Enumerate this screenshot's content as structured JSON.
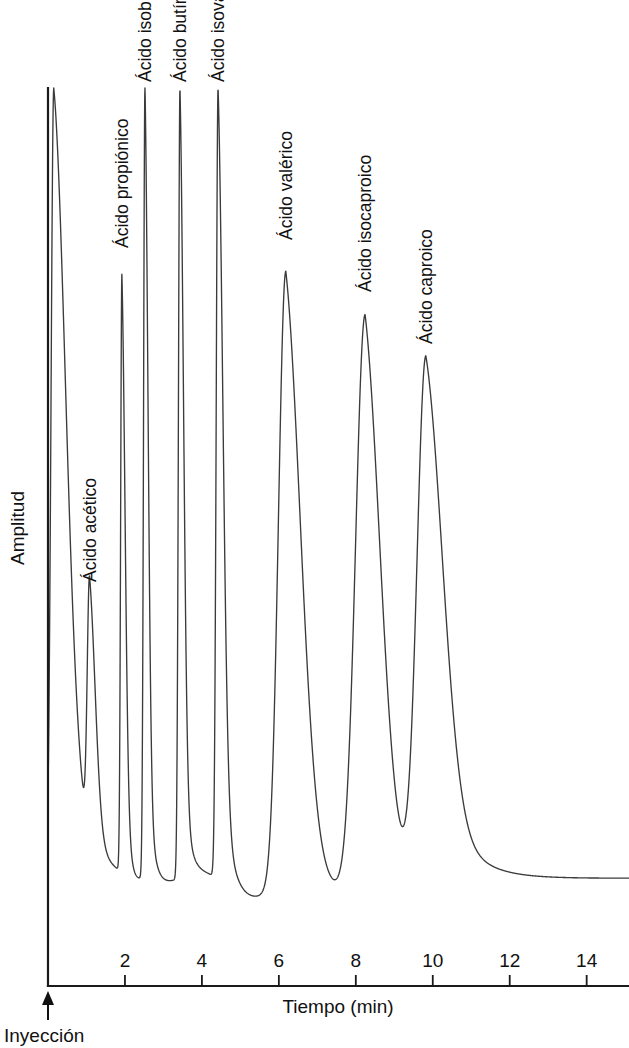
{
  "figure": {
    "kind": "chromatogram",
    "background_color": "#ffffff",
    "trace_color": "#3b3b3b",
    "axis_color": "#1a1a1a",
    "text_color": "#111111"
  },
  "chart_data": {
    "type": "line",
    "title": "",
    "subtitle": "",
    "xlabel": "Tiempo (min)",
    "ylabel": "Amplitud",
    "xlim": [
      0,
      15.1
    ],
    "ylim": [
      0,
      100
    ],
    "grid": false,
    "legend": "none",
    "x_ticks": [
      2,
      4,
      6,
      8,
      10,
      12,
      14
    ],
    "x_tick_labels": [
      "2",
      "4",
      "6",
      "8",
      "10",
      "12",
      "14"
    ],
    "y_ticks": [],
    "y_tick_labels": [],
    "annotations": [
      {
        "text": "Inyección",
        "x": 0,
        "y": 0,
        "marker": "up-arrow"
      }
    ],
    "baseline_level": 12,
    "series": [
      {
        "name": "Cromatograma de ácidos grasos volátiles",
        "peaks": [
          {
            "label": "Inyección (disolvente)",
            "retention_time": 0.15,
            "apex_amplitude": 100,
            "clipped_at_top": true,
            "labelled": false,
            "width_left": 0.18,
            "width_right": 0.72,
            "valley_after": 17
          },
          {
            "label": "Ácido acético",
            "retention_time": 1.08,
            "apex_amplitude": 41.5,
            "clipped_at_top": false,
            "labelled": true,
            "width_left": 0.15,
            "width_right": 0.36,
            "valley_after": 12
          },
          {
            "label": "Ácido propiónico",
            "retention_time": 1.92,
            "apex_amplitude": 78.5,
            "clipped_at_top": false,
            "labelled": true,
            "width_left": 0.08,
            "width_right": 0.2,
            "valley_after": 10
          },
          {
            "label": "Ácido isobutírico",
            "retention_time": 2.52,
            "apex_amplitude": 100,
            "clipped_at_top": true,
            "labelled": true,
            "width_left": 0.09,
            "width_right": 0.19,
            "valley_after": 11
          },
          {
            "label": "Ácido butírico",
            "retention_time": 3.43,
            "apex_amplitude": 100,
            "clipped_at_top": true,
            "labelled": true,
            "width_left": 0.1,
            "width_right": 0.22,
            "valley_after": 13
          },
          {
            "label": "Ácido isovalérico",
            "retention_time": 4.42,
            "apex_amplitude": 100,
            "clipped_at_top": true,
            "labelled": true,
            "width_left": 0.12,
            "width_right": 0.3,
            "valley_after": 8
          },
          {
            "label": "Ácido valérico",
            "retention_time": 6.18,
            "apex_amplitude": 79.6,
            "clipped_at_top": false,
            "labelled": true,
            "width_left": 0.48,
            "width_right": 0.92,
            "valley_after": 6
          },
          {
            "label": "Ácido isocaproico",
            "retention_time": 8.24,
            "apex_amplitude": 74.2,
            "clipped_at_top": false,
            "labelled": true,
            "width_left": 0.62,
            "width_right": 0.95,
            "valley_after": 7
          },
          {
            "label": "Ácido caproico",
            "retention_time": 9.82,
            "apex_amplitude": 68.8,
            "clipped_at_top": false,
            "labelled": true,
            "width_left": 0.58,
            "width_right": 1.05,
            "valley_after": 5
          }
        ]
      }
    ],
    "peak_labels": [
      {
        "text": "Ácido acético",
        "anchor_x": 1.08,
        "anchor_y_px": 582,
        "rotation": -90
      },
      {
        "text": "Ácido propiónico",
        "anchor_x": 1.92,
        "anchor_y_px": 248,
        "rotation": -90
      },
      {
        "text": "Ácido isobutírico",
        "anchor_x": 2.52,
        "anchor_y_px": 82,
        "rotation": -90
      },
      {
        "text": "Ácido butírico",
        "anchor_x": 3.43,
        "anchor_y_px": 82,
        "rotation": -90
      },
      {
        "text": "Ácido isovalérico",
        "anchor_x": 4.42,
        "anchor_y_px": 82,
        "rotation": -90
      },
      {
        "text": "Ácido valérico",
        "anchor_x": 6.18,
        "anchor_y_px": 240,
        "rotation": -90
      },
      {
        "text": "Ácido isocaproico",
        "anchor_x": 8.24,
        "anchor_y_px": 292,
        "rotation": -90
      },
      {
        "text": "Ácido caproico",
        "anchor_x": 9.82,
        "anchor_y_px": 344,
        "rotation": -90
      }
    ]
  }
}
